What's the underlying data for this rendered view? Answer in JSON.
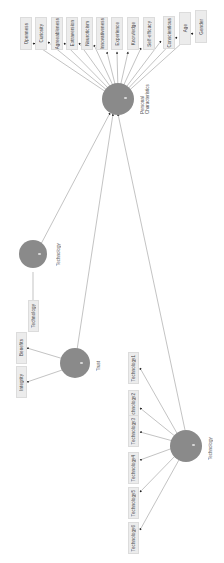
{
  "diagram": {
    "orientation": "rotated-90",
    "colors": {
      "node": "#8a8a8a",
      "box": "#ececec",
      "box_border": "#dcdcdc",
      "edge": "#999999",
      "arrowhead": "#222222"
    },
    "central_node": {
      "label": "Personal Characteristics",
      "label_lines": [
        "Personal",
        "Characteristics"
      ]
    },
    "top_boxes": [
      {
        "label": "Openness"
      },
      {
        "label": "Curiosity"
      },
      {
        "label": "Agreeableness"
      },
      {
        "label": "Extraversion"
      },
      {
        "label": "Neuroticism"
      },
      {
        "label": "Innovativeness"
      },
      {
        "label": "Experience"
      },
      {
        "label": "Knowledge"
      },
      {
        "label": "Self-efficacy"
      },
      {
        "label": "Conscientious"
      },
      {
        "label": "Age"
      },
      {
        "label": "Gender"
      }
    ],
    "technology_node": {
      "label": "Technology"
    },
    "technology_box": {
      "label": "Technology"
    },
    "trust_node": {
      "label": "Trust"
    },
    "trust_boxes": [
      {
        "label": "Benefits"
      },
      {
        "label": "Integrity"
      }
    ],
    "bottom_node": {
      "label": "Technology"
    },
    "bottom_boxes": [
      {
        "label": "Technology1"
      },
      {
        "label": "Technology2"
      },
      {
        "label": "Technology3"
      },
      {
        "label": "Technology4"
      },
      {
        "label": "Technology5"
      },
      {
        "label": "Technology6"
      }
    ]
  }
}
